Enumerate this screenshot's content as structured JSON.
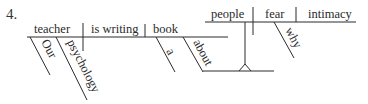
{
  "exercise_number": "4.",
  "diagram": {
    "main_clause": {
      "subject": "teacher",
      "verb": "is writing",
      "direct_object": "book",
      "subject_modifiers": [
        "Our",
        "psychology"
      ],
      "object_modifiers": [
        "a"
      ],
      "preposition": "about"
    },
    "noun_clause": {
      "subject": "people",
      "verb": "fear",
      "direct_object": "intimacy",
      "verb_modifiers": [
        "why"
      ]
    }
  }
}
